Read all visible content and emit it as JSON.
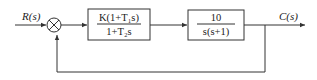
{
  "diagram": {
    "type": "block-diagram",
    "input_label": "R(s)",
    "output_label": "C(s)",
    "summing_junction": {
      "symbol": "crossed-circle",
      "feedback": "unity"
    },
    "blocks": [
      {
        "name": "controller",
        "numerator": "K(1+T₁s)",
        "denominator": "1+T₂s"
      },
      {
        "name": "plant",
        "numerator": "10",
        "denominator": "s(s+1)"
      }
    ]
  }
}
